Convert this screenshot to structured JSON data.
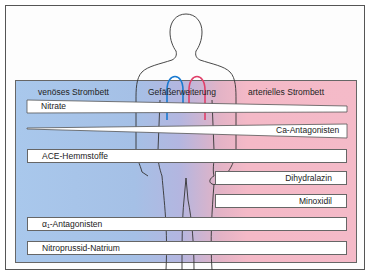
{
  "diagram": {
    "headers": {
      "venous": "venöses Strombett",
      "center": "Gefäßerweiterung",
      "arterial": "arterielles Strombett"
    },
    "drugs": [
      {
        "label": "Nitrate",
        "side": "venous",
        "shape": "wedge-narrowing-right"
      },
      {
        "label": "Ca-Antagonisten",
        "side": "arterial",
        "shape": "wedge-narrowing-left"
      },
      {
        "label": "ACE-Hemmstoffe",
        "side": "both",
        "shape": "bar"
      },
      {
        "label": "Dihydralazin",
        "side": "arterial",
        "shape": "bar-right-only"
      },
      {
        "label": "Minoxidil",
        "side": "arterial",
        "shape": "bar-right-only"
      },
      {
        "label": "α₁-Antagonisten",
        "side": "both",
        "shape": "bar"
      },
      {
        "label": "Nitroprussid-Natrium",
        "side": "both",
        "shape": "bar"
      }
    ],
    "colors": {
      "venous": "#a9c8ec",
      "arterial": "#f4bac8",
      "vein_line": "#1a7ad0",
      "artery_line": "#e0406a",
      "outline": "#333333"
    }
  }
}
